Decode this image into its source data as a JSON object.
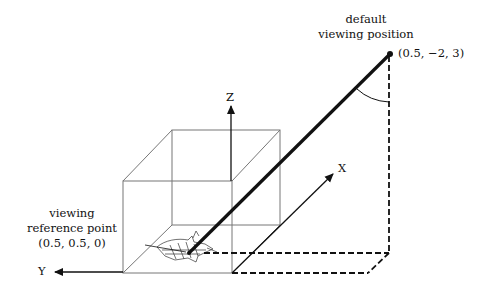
{
  "labels": {
    "viewpoint_line1": "default",
    "viewpoint_line2": "viewing position",
    "viewpoint_coords": "(0.5,  −2,  3)",
    "ref_line1": "viewing",
    "ref_line2": "reference point",
    "ref_coords": "(0.5,  0.5,  0)"
  },
  "axes": {
    "x": "X",
    "y": "Y",
    "z": "Z"
  },
  "colors": {
    "line": "#111111",
    "box": "#777777"
  }
}
